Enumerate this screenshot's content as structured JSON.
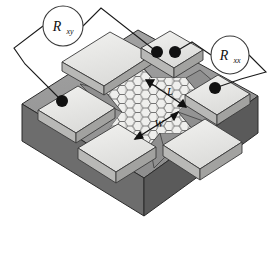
{
  "figure": {
    "type": "device-schematic",
    "background_color": "#ffffff"
  },
  "meters": [
    {
      "id": "r-xy",
      "base_symbol": "R",
      "subscript": "xy",
      "cx": 63,
      "cy": 26,
      "r": 20
    },
    {
      "id": "r-xx",
      "base_symbol": "R",
      "subscript": "xx",
      "cx": 230,
      "cy": 55,
      "r": 19
    }
  ],
  "dimension_labels": [
    {
      "id": "length",
      "text": "L",
      "x": 170,
      "y": 95
    },
    {
      "id": "width",
      "text": "W",
      "x": 159,
      "y": 127
    }
  ],
  "contact_pads": [
    {
      "id": "pad-top-left",
      "dots": 0
    },
    {
      "id": "pad-top-right",
      "dots": 2
    },
    {
      "id": "pad-mid-left",
      "dots": 1
    },
    {
      "id": "pad-mid-right",
      "dots": 1
    },
    {
      "id": "pad-bottom-left",
      "dots": 0
    },
    {
      "id": "pad-bottom-right",
      "dots": 0
    }
  ],
  "bond_dots": [
    {
      "id": "dot-mid-left",
      "cx": 62,
      "cy": 101,
      "r": 6
    },
    {
      "id": "dot-top-right-a",
      "cx": 157,
      "cy": 52,
      "r": 6
    },
    {
      "id": "dot-top-right-b",
      "cx": 175,
      "cy": 52,
      "r": 6
    },
    {
      "id": "dot-mid-right",
      "cx": 215,
      "cy": 88,
      "r": 6
    }
  ],
  "colors": {
    "substrate_top": "#9a9a9a",
    "substrate_front": "#6d6d6d",
    "substrate_side": "#5a5a5a",
    "pad_top": "#e8e8e6",
    "pad_front": "#b8b8b6",
    "pad_side": "#a2a2a0",
    "lead_gray": "#8f8f8f",
    "honeycomb_fill": "#d8d8d6",
    "honeycomb_stroke": "#6a6a6a",
    "wire": "#1a1a1a",
    "dot": "#111111",
    "meter_circle_stroke": "#3a3a3a",
    "meter_circle_fill": "#ffffff",
    "outline": "#2b2b2b"
  },
  "honeycomb": {
    "cell_radius": 5.2,
    "stroke_width": 0.7,
    "description": "hexagonal graphene lattice forming the hall-bar mesa"
  }
}
